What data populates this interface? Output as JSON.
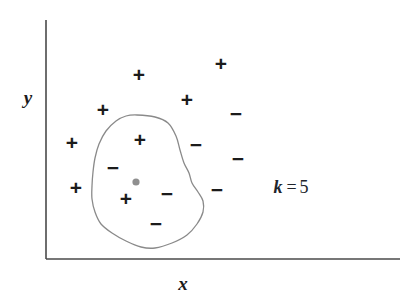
{
  "figure": {
    "background": "#ffffff"
  },
  "axes": {
    "x_label": "x",
    "y_label": "y",
    "axis_color": "#4a4a4a",
    "x_axis": {
      "x1": 46,
      "y1": 259,
      "x2": 400,
      "y2": 259
    },
    "y_axis": {
      "x1": 46,
      "y1": 20,
      "x2": 46,
      "y2": 259
    },
    "x_label_pos": {
      "x": 183,
      "y": 283
    },
    "y_label_pos": {
      "x": 28,
      "y": 97
    }
  },
  "neighbourhood": {
    "label": "k-neighbourhood-boundary",
    "stroke": "#8a8a8a",
    "stroke_width": 1.3,
    "fill": "none"
  },
  "query_point": {
    "label": "query-point",
    "x": 136,
    "y": 182,
    "radius": 3.6,
    "color": "#8f8f8f"
  },
  "annotation": {
    "symbol": "k",
    "operator": "=",
    "value": "5",
    "x": 291,
    "y": 187
  },
  "chart_data": {
    "type": "scatter",
    "title": "",
    "xlabel": "x",
    "ylabel": "y",
    "grid": false,
    "legend": null,
    "annotations": [
      {
        "text": "k = 5",
        "x": 291,
        "y": 187
      }
    ],
    "series": [
      {
        "name": "positive",
        "marker": "+",
        "color": "#1b1b1b",
        "points": [
          {
            "x": 221,
            "y": 63,
            "inside_neighbourhood": false
          },
          {
            "x": 139,
            "y": 74,
            "inside_neighbourhood": false
          },
          {
            "x": 187,
            "y": 99,
            "inside_neighbourhood": false
          },
          {
            "x": 103,
            "y": 109,
            "inside_neighbourhood": false
          },
          {
            "x": 72,
            "y": 142,
            "inside_neighbourhood": false
          },
          {
            "x": 140,
            "y": 139,
            "inside_neighbourhood": true
          },
          {
            "x": 76,
            "y": 187,
            "inside_neighbourhood": false
          },
          {
            "x": 126,
            "y": 198,
            "inside_neighbourhood": true
          }
        ]
      },
      {
        "name": "negative",
        "marker": "−",
        "color": "#1b1b1b",
        "points": [
          {
            "x": 236,
            "y": 113,
            "inside_neighbourhood": false
          },
          {
            "x": 113,
            "y": 167,
            "inside_neighbourhood": true
          },
          {
            "x": 196,
            "y": 144,
            "inside_neighbourhood": false
          },
          {
            "x": 238,
            "y": 158,
            "inside_neighbourhood": false
          },
          {
            "x": 167,
            "y": 193,
            "inside_neighbourhood": true
          },
          {
            "x": 217,
            "y": 189,
            "inside_neighbourhood": false
          },
          {
            "x": 156,
            "y": 223,
            "inside_neighbourhood": true
          }
        ]
      },
      {
        "name": "query",
        "marker": "●",
        "color": "#8f8f8f",
        "points": [
          {
            "x": 136,
            "y": 182,
            "inside_neighbourhood": true
          }
        ]
      }
    ],
    "neighbourhood_outline": [
      [
        137,
        115
      ],
      [
        155,
        117
      ],
      [
        168,
        123
      ],
      [
        176,
        136
      ],
      [
        180,
        150
      ],
      [
        184,
        163
      ],
      [
        189,
        173
      ],
      [
        192,
        183
      ],
      [
        198,
        192
      ],
      [
        203,
        201
      ],
      [
        203,
        212
      ],
      [
        197,
        224
      ],
      [
        187,
        235
      ],
      [
        172,
        243
      ],
      [
        155,
        248
      ],
      [
        141,
        247
      ],
      [
        126,
        241
      ],
      [
        112,
        233
      ],
      [
        101,
        224
      ],
      [
        95,
        212
      ],
      [
        92,
        199
      ],
      [
        92,
        186
      ],
      [
        93,
        172
      ],
      [
        95,
        158
      ],
      [
        99,
        144
      ],
      [
        106,
        131
      ],
      [
        116,
        121
      ],
      [
        126,
        116
      ]
    ]
  }
}
